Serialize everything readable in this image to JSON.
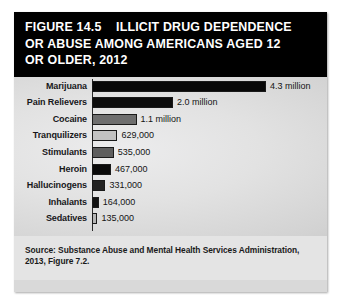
{
  "figure": {
    "title": "FIGURE 14.5    ILLICIT DRUG DEPENDENCE OR ABUSE AMONG AMERICANS AGED 12 OR OLDER, 2012",
    "source": "Source: Substance Abuse and Mental Health Services Administration, 2013, Figure 7.2."
  },
  "colors": {
    "title_background": "#000000",
    "title_text": "#ffffff",
    "chart_background": "#d9d9d9",
    "source_background": "#e4e4e4",
    "bar_outline": "#1a1a1a"
  },
  "chart_data": {
    "type": "bar",
    "orientation": "horizontal",
    "title": "FIGURE 14.5    ILLICIT DRUG DEPENDENCE OR ABUSE AMONG AMERICANS AGED 12 OR OLDER, 2012",
    "xlabel": "",
    "ylabel": "",
    "grid": false,
    "legend": false,
    "xlim": [
      0,
      4300000
    ],
    "unit": "people",
    "categories": [
      "Marijuana",
      "Pain Relievers",
      "Cocaine",
      "Tranquilizers",
      "Stimulants",
      "Heroin",
      "Hallucinogens",
      "Inhalants",
      "Sedatives"
    ],
    "values": [
      4300000,
      2000000,
      1100000,
      629000,
      535000,
      467000,
      331000,
      164000,
      135000
    ],
    "value_labels": [
      "4.3 million",
      "2.0 million",
      "1.1 million",
      "629,000",
      "535,000",
      "467,000",
      "331,000",
      "164,000",
      "135,000"
    ],
    "bar_fills": [
      "#080808",
      "#0d0d0d",
      "#6e6e6e",
      "#c2c2c2",
      "#5e5e5e",
      "#0a0a0a",
      "#232323",
      "#111111",
      "#b5b5b5"
    ]
  }
}
